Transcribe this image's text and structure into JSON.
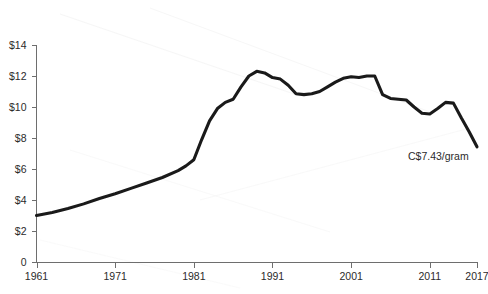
{
  "chart_data": {
    "type": "line",
    "title": "",
    "subtitle": "",
    "xlabel": "",
    "ylabel": "",
    "xlim": [
      1961,
      2017
    ],
    "ylim": [
      0,
      14
    ],
    "grid": false,
    "legend": null,
    "y_tick_labels": [
      "$14",
      "$12",
      "$10",
      "$8",
      "$6",
      "$4",
      "$2",
      "0"
    ],
    "y_tick_values": [
      14,
      12,
      10,
      8,
      6,
      4,
      2,
      0
    ],
    "x_tick_labels": [
      "1961",
      "1971",
      "1981",
      "1991",
      "2001",
      "2011",
      "2017"
    ],
    "x_tick_values": [
      1961,
      1971,
      1981,
      1991,
      2001,
      2011,
      2017
    ],
    "series": [
      {
        "name": "Cannabis price",
        "color": "#1a1a1a",
        "x": [
          1961,
          1963,
          1965,
          1967,
          1969,
          1971,
          1973,
          1975,
          1977,
          1979,
          1980,
          1981,
          1982,
          1983,
          1984,
          1985,
          1986,
          1987,
          1988,
          1989,
          1990,
          1991,
          1992,
          1993,
          1994,
          1995,
          1996,
          1997,
          1998,
          1999,
          2000,
          2001,
          2002,
          2003,
          2004,
          2005,
          2006,
          2007,
          2008,
          2009,
          2010,
          2011,
          2012,
          2013,
          2014,
          2015,
          2016,
          2017
        ],
        "values": [
          3.0,
          3.2,
          3.45,
          3.75,
          4.1,
          4.4,
          4.75,
          5.1,
          5.45,
          5.9,
          6.2,
          6.6,
          7.9,
          9.1,
          9.9,
          10.3,
          10.5,
          11.3,
          12.0,
          12.3,
          12.2,
          11.9,
          11.8,
          11.4,
          10.85,
          10.8,
          10.85,
          11.0,
          11.3,
          11.6,
          11.85,
          11.95,
          11.9,
          12.0,
          12.0,
          10.8,
          10.55,
          10.5,
          10.45,
          10.0,
          9.6,
          9.55,
          9.9,
          10.3,
          10.25,
          9.3,
          8.4,
          7.43
        ]
      }
    ],
    "annotations": [
      {
        "text": "C$7.43/gram",
        "x": 2017,
        "y": 7.43,
        "label": "end-point-value"
      }
    ]
  }
}
